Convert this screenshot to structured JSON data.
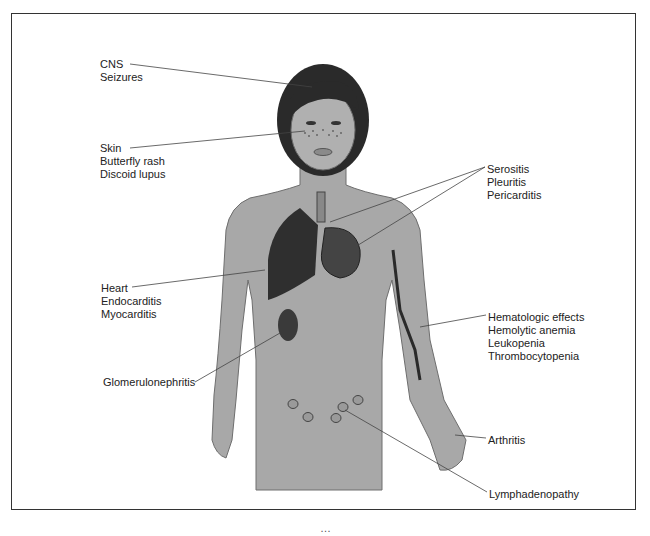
{
  "diagram": {
    "labels": [
      {
        "id": "cns",
        "lines": [
          "CNS",
          "Seizures"
        ],
        "x": 100,
        "y": 58
      },
      {
        "id": "skin",
        "lines": [
          "Skin",
          "Butterfly rash",
          "Discoid lupus"
        ],
        "x": 100,
        "y": 142
      },
      {
        "id": "serositis",
        "lines": [
          "Serositis",
          "Pleuritis",
          "Pericarditis"
        ],
        "x": 487,
        "y": 163
      },
      {
        "id": "heart",
        "lines": [
          "Heart",
          "Endocarditis",
          "Myocarditis"
        ],
        "x": 101,
        "y": 282
      },
      {
        "id": "hematologic",
        "lines": [
          "Hematologic effects",
          "Hemolytic anemia",
          "Leukopenia",
          "Thrombocytopenia"
        ],
        "x": 488,
        "y": 311
      },
      {
        "id": "glomerulonephritis",
        "lines": [
          "Glomerulonephritis"
        ],
        "x": 103,
        "y": 376
      },
      {
        "id": "arthritis",
        "lines": [
          "Arthritis"
        ],
        "x": 488,
        "y": 434
      },
      {
        "id": "lymphadenopathy",
        "lines": [
          "Lymphadenopathy"
        ],
        "x": 489,
        "y": 488
      }
    ],
    "colors": {
      "skin": "#a8a8a8",
      "skin_edge": "#6e6e6e",
      "hair": "#2a2a2a",
      "organ": "#3a3a3a",
      "line": "#444444",
      "frame": "#333333"
    }
  },
  "caption": {
    "text": "…"
  }
}
